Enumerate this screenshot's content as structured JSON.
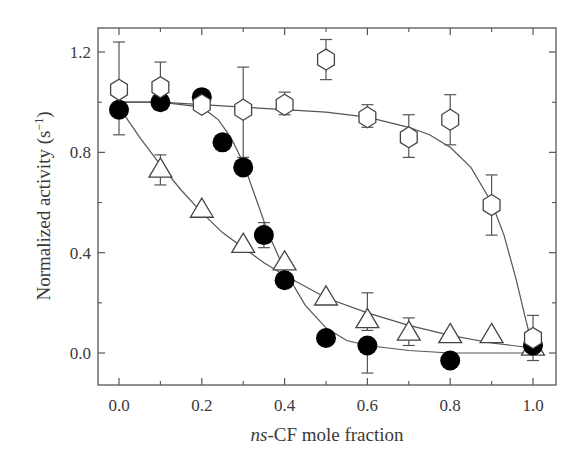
{
  "chart_data": {
    "type": "scatter",
    "title": "",
    "xlabel_italic": "ns",
    "xlabel_rest": "-CF mole fraction",
    "ylabel_text": "Normalized activity (s",
    "ylabel_sup": "−1",
    "ylabel_close": ")",
    "xlim": [
      -0.07,
      1.05
    ],
    "ylim": [
      -0.13,
      1.3
    ],
    "xticks": [
      0.0,
      0.2,
      0.4,
      0.6,
      0.8,
      1.0
    ],
    "xtick_labels": [
      "0.0",
      "0.2",
      "0.4",
      "0.6",
      "0.8",
      "1.0"
    ],
    "xminor": [
      0.1,
      0.3,
      0.5,
      0.7,
      0.9
    ],
    "yticks": [
      0.0,
      0.4,
      0.8,
      1.2
    ],
    "ytick_labels": [
      "0.0",
      "0.4",
      "0.8",
      "1.2"
    ],
    "yminor": [
      0.2,
      0.6,
      1.0
    ],
    "grid": false,
    "legend": null,
    "series": [
      {
        "name": "hexagon-open",
        "marker": "hexagon",
        "fill": "#ffffff",
        "x": [
          0.0,
          0.1,
          0.2,
          0.3,
          0.4,
          0.5,
          0.6,
          0.7,
          0.8,
          0.9,
          1.0
        ],
        "y": [
          1.05,
          1.06,
          0.99,
          0.97,
          0.99,
          1.17,
          0.94,
          0.86,
          0.93,
          0.59,
          0.06
        ],
        "err_low": [
          0.87,
          1.01,
          0.99,
          0.78,
          0.95,
          1.09,
          0.9,
          0.78,
          0.83,
          0.47,
          -0.03
        ],
        "err_high": [
          1.24,
          1.16,
          0.99,
          1.14,
          1.04,
          1.25,
          0.99,
          0.95,
          1.03,
          0.71,
          0.15
        ],
        "fit_x": [
          0.0,
          0.1,
          0.2,
          0.3,
          0.4,
          0.5,
          0.6,
          0.7,
          0.75,
          0.8,
          0.85,
          0.9,
          0.93,
          0.96,
          0.98,
          1.0
        ],
        "fit_y": [
          1.0,
          1.0,
          0.99,
          0.98,
          0.97,
          0.96,
          0.94,
          0.9,
          0.87,
          0.82,
          0.74,
          0.6,
          0.47,
          0.29,
          0.15,
          0.02
        ]
      },
      {
        "name": "circle-filled",
        "marker": "circle",
        "fill": "#000000",
        "x": [
          0.0,
          0.1,
          0.2,
          0.25,
          0.3,
          0.35,
          0.4,
          0.5,
          0.6,
          0.8,
          1.0
        ],
        "y": [
          0.97,
          1.0,
          1.02,
          0.84,
          0.74,
          0.47,
          0.29,
          0.06,
          0.03,
          -0.03,
          0.03
        ],
        "err_low": [
          0.97,
          0.97,
          1.02,
          0.84,
          0.74,
          0.42,
          0.29,
          0.06,
          -0.08,
          -0.03,
          0.03
        ],
        "err_high": [
          0.97,
          1.0,
          1.02,
          0.84,
          0.74,
          0.52,
          0.29,
          0.06,
          0.03,
          -0.03,
          0.03
        ],
        "fit_x": [
          0.0,
          0.1,
          0.2,
          0.24,
          0.27,
          0.3,
          0.33,
          0.36,
          0.4,
          0.45,
          0.5,
          0.55,
          0.6,
          0.7,
          0.8,
          0.9,
          1.0
        ],
        "fit_y": [
          1.0,
          1.0,
          0.98,
          0.93,
          0.86,
          0.76,
          0.62,
          0.48,
          0.33,
          0.19,
          0.1,
          0.05,
          0.03,
          0.01,
          0.0,
          0.0,
          0.0
        ]
      },
      {
        "name": "triangle-open",
        "marker": "triangle",
        "fill": "#ffffff",
        "x": [
          0.1,
          0.2,
          0.3,
          0.4,
          0.5,
          0.6,
          0.7,
          0.8,
          0.9,
          1.0
        ],
        "y": [
          0.73,
          0.57,
          0.43,
          0.36,
          0.22,
          0.13,
          0.08,
          0.07,
          0.07,
          0.02
        ],
        "err_low": [
          0.67,
          0.57,
          0.43,
          0.36,
          0.22,
          0.09,
          0.03,
          0.07,
          0.07,
          0.02
        ],
        "err_high": [
          0.79,
          0.57,
          0.43,
          0.36,
          0.22,
          0.24,
          0.14,
          0.07,
          0.07,
          0.02
        ],
        "fit_x": [
          0.0,
          0.05,
          0.1,
          0.15,
          0.2,
          0.25,
          0.3,
          0.35,
          0.4,
          0.5,
          0.6,
          0.7,
          0.8,
          0.9,
          1.0
        ],
        "fit_y": [
          0.98,
          0.86,
          0.75,
          0.65,
          0.56,
          0.48,
          0.42,
          0.36,
          0.31,
          0.22,
          0.16,
          0.11,
          0.07,
          0.04,
          0.02
        ]
      }
    ]
  }
}
